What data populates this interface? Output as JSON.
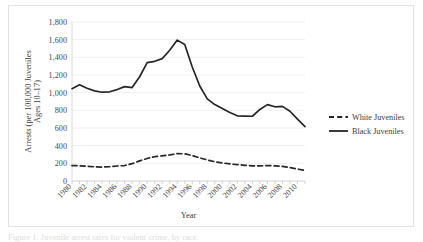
{
  "figure": {
    "caption": "Figure 1. Juvenile arrest rates for violent crime, by race.",
    "frame_color": "#e3e3e3"
  },
  "chart_data": {
    "type": "line",
    "title": "",
    "xlabel": "Year",
    "ylabel": "Arrests (per 100,000 Juveniles Ages 10–17)",
    "ylabel_line1": "Arrests (per 100,000 Juveniles",
    "ylabel_line2": "Ages 10–17)",
    "ylim": [
      0,
      1800
    ],
    "ytick_step": 200,
    "ytick_labels": [
      "0",
      "200",
      "400",
      "600",
      "800",
      "1,000",
      "1,200",
      "1,400",
      "1,600",
      "1,800"
    ],
    "ytick_values": [
      0,
      200,
      400,
      600,
      800,
      1000,
      1200,
      1400,
      1600,
      1800
    ],
    "grid": true,
    "grid_axis": "y",
    "legend_position": "right",
    "xlim": [
      1980,
      2011
    ],
    "xtick_labels": [
      "1980",
      "1982",
      "1984",
      "1986",
      "1988",
      "1990",
      "1992",
      "1994",
      "1996",
      "1998",
      "2000",
      "2002",
      "2004",
      "2006",
      "2008",
      "2010"
    ],
    "xtick_values": [
      1980,
      1982,
      1984,
      1986,
      1988,
      1990,
      1992,
      1994,
      1996,
      1998,
      2000,
      2002,
      2004,
      2006,
      2008,
      2010
    ],
    "xtick_rotation": 45,
    "x": [
      1980,
      1981,
      1982,
      1983,
      1984,
      1985,
      1986,
      1987,
      1988,
      1989,
      1990,
      1991,
      1992,
      1993,
      1994,
      1995,
      1996,
      1997,
      1998,
      1999,
      2000,
      2001,
      2002,
      2003,
      2004,
      2005,
      2006,
      2007,
      2008,
      2009,
      2010,
      2011
    ],
    "series": [
      {
        "name": "White Juveniles",
        "style": "dashed",
        "color": "#262626",
        "values": [
          175,
          172,
          168,
          160,
          157,
          162,
          170,
          175,
          196,
          228,
          255,
          275,
          285,
          295,
          310,
          308,
          288,
          262,
          238,
          218,
          205,
          193,
          186,
          178,
          172,
          172,
          174,
          172,
          165,
          152,
          135,
          120
        ]
      },
      {
        "name": "Black Juveniles",
        "style": "solid",
        "color": "#262626",
        "values": [
          1045,
          1090,
          1050,
          1020,
          1005,
          1010,
          1035,
          1068,
          1058,
          1180,
          1340,
          1355,
          1385,
          1480,
          1595,
          1545,
          1290,
          1075,
          930,
          865,
          820,
          775,
          738,
          735,
          733,
          810,
          865,
          840,
          845,
          790,
          700,
          615
        ]
      }
    ],
    "legend": [
      {
        "label": "White Juveniles",
        "style": "dashed"
      },
      {
        "label": "Black Juveniles",
        "style": "solid"
      }
    ]
  }
}
